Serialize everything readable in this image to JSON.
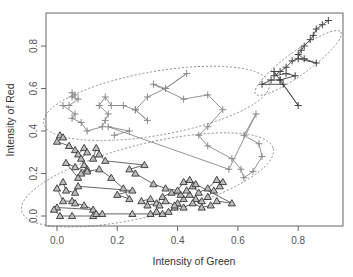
{
  "chart_data": {
    "type": "scatter",
    "title": "",
    "xlabel": "Intensity of Green",
    "ylabel": "Intensity of Red",
    "xlim": [
      -0.04,
      0.95
    ],
    "ylim": [
      -0.05,
      0.95
    ],
    "x_ticks": [
      0.0,
      0.2,
      0.4,
      0.6,
      0.8
    ],
    "x_tick_labels": [
      "0.0",
      "0.2",
      "0.4",
      "0.6",
      "0.8"
    ],
    "y_ticks": [
      0.0,
      0.2,
      0.4,
      0.6,
      0.8
    ],
    "y_tick_labels": [
      "0.0",
      "0.2",
      "0.4",
      "0.6",
      "0.8"
    ],
    "grid": false,
    "legend": null,
    "series": [
      {
        "name": "cluster-dark-plus",
        "marker": "plus",
        "color": "#444444",
        "connected": true,
        "points": [
          [
            0.9,
            0.92
          ],
          [
            0.88,
            0.9
          ],
          [
            0.86,
            0.88
          ],
          [
            0.85,
            0.85
          ],
          [
            0.84,
            0.83
          ],
          [
            0.82,
            0.8
          ],
          [
            0.81,
            0.78
          ],
          [
            0.8,
            0.76
          ],
          [
            0.82,
            0.74
          ],
          [
            0.86,
            0.72
          ],
          [
            0.8,
            0.74
          ],
          [
            0.78,
            0.73
          ],
          [
            0.76,
            0.7
          ],
          [
            0.74,
            0.68
          ],
          [
            0.72,
            0.66
          ],
          [
            0.76,
            0.67
          ],
          [
            0.79,
            0.66
          ],
          [
            0.74,
            0.64
          ],
          [
            0.71,
            0.64
          ],
          [
            0.68,
            0.62
          ],
          [
            0.75,
            0.62
          ],
          [
            0.8,
            0.52
          ],
          [
            0.74,
            0.64
          ],
          [
            0.72,
            0.68
          ]
        ]
      },
      {
        "name": "cluster-gray-plus",
        "marker": "plus",
        "color": "#888888",
        "connected": true,
        "points": [
          [
            0.05,
            0.58
          ],
          [
            0.06,
            0.57
          ],
          [
            0.05,
            0.56
          ],
          [
            0.07,
            0.55
          ],
          [
            0.04,
            0.52
          ],
          [
            0.02,
            0.52
          ],
          [
            0.06,
            0.48
          ],
          [
            0.05,
            0.46
          ],
          [
            0.08,
            0.44
          ],
          [
            0.1,
            0.4
          ],
          [
            0.15,
            0.42
          ],
          [
            0.16,
            0.45
          ],
          [
            0.17,
            0.48
          ],
          [
            0.14,
            0.52
          ],
          [
            0.16,
            0.56
          ],
          [
            0.18,
            0.52
          ],
          [
            0.22,
            0.52
          ],
          [
            0.26,
            0.5
          ],
          [
            0.3,
            0.45
          ],
          [
            0.26,
            0.5
          ],
          [
            0.3,
            0.56
          ],
          [
            0.36,
            0.6
          ],
          [
            0.43,
            0.67
          ],
          [
            0.36,
            0.6
          ],
          [
            0.32,
            0.62
          ],
          [
            0.42,
            0.55
          ],
          [
            0.5,
            0.57
          ],
          [
            0.55,
            0.5
          ],
          [
            0.5,
            0.42
          ],
          [
            0.47,
            0.38
          ],
          [
            0.5,
            0.33
          ],
          [
            0.58,
            0.27
          ],
          [
            0.61,
            0.22
          ],
          [
            0.62,
            0.18
          ],
          [
            0.65,
            0.21
          ],
          [
            0.68,
            0.28
          ],
          [
            0.67,
            0.34
          ],
          [
            0.62,
            0.38
          ],
          [
            0.66,
            0.48
          ],
          [
            0.57,
            0.22
          ],
          [
            0.17,
            0.42
          ],
          [
            0.24,
            0.4
          ],
          [
            0.19,
            0.38
          ]
        ]
      },
      {
        "name": "cluster-triangles",
        "marker": "triangle",
        "color": "#555555",
        "connected": true,
        "points": [
          [
            0.01,
            0.38
          ],
          [
            0.02,
            0.37
          ],
          [
            0.0,
            0.35
          ],
          [
            0.04,
            0.33
          ],
          [
            0.06,
            0.31
          ],
          [
            0.07,
            0.29
          ],
          [
            0.09,
            0.32
          ],
          [
            0.1,
            0.3
          ],
          [
            0.08,
            0.27
          ],
          [
            0.09,
            0.24
          ],
          [
            0.1,
            0.22
          ],
          [
            0.08,
            0.2
          ],
          [
            0.07,
            0.18
          ],
          [
            0.03,
            0.25
          ],
          [
            0.06,
            0.23
          ],
          [
            0.1,
            0.21
          ],
          [
            0.14,
            0.22
          ],
          [
            0.18,
            0.18
          ],
          [
            0.22,
            0.13
          ],
          [
            0.24,
            0.08
          ],
          [
            0.2,
            0.1
          ],
          [
            0.25,
            0.12
          ],
          [
            0.07,
            0.14
          ],
          [
            0.06,
            0.11
          ],
          [
            0.03,
            0.12
          ],
          [
            0.02,
            0.16
          ],
          [
            0.0,
            0.13
          ],
          [
            0.02,
            0.07
          ],
          [
            0.05,
            0.07
          ],
          [
            0.06,
            0.06
          ],
          [
            0.09,
            0.05
          ],
          [
            0.12,
            0.03
          ],
          [
            0.0,
            0.04
          ],
          [
            -0.01,
            0.03
          ],
          [
            0.01,
            0.0
          ],
          [
            0.05,
            0.0
          ],
          [
            0.12,
            0.0
          ],
          [
            0.13,
            0.01
          ],
          [
            0.15,
            0.01
          ],
          [
            0.25,
            0.01
          ],
          [
            0.31,
            0.01
          ],
          [
            0.33,
            0.02
          ],
          [
            0.35,
            0.01
          ],
          [
            0.37,
            0.02
          ],
          [
            0.39,
            0.04
          ],
          [
            0.4,
            0.06
          ],
          [
            0.42,
            0.08
          ],
          [
            0.44,
            0.1
          ],
          [
            0.46,
            0.08
          ],
          [
            0.48,
            0.07
          ],
          [
            0.5,
            0.09
          ],
          [
            0.52,
            0.12
          ],
          [
            0.54,
            0.14
          ],
          [
            0.55,
            0.16
          ],
          [
            0.53,
            0.17
          ],
          [
            0.5,
            0.13
          ],
          [
            0.47,
            0.11
          ],
          [
            0.45,
            0.14
          ],
          [
            0.43,
            0.12
          ],
          [
            0.41,
            0.1
          ],
          [
            0.38,
            0.11
          ],
          [
            0.35,
            0.09
          ],
          [
            0.33,
            0.06
          ],
          [
            0.3,
            0.05
          ],
          [
            0.28,
            0.07
          ],
          [
            0.31,
            0.08
          ],
          [
            0.34,
            0.05
          ],
          [
            0.36,
            0.07
          ],
          [
            0.39,
            0.05
          ],
          [
            0.42,
            0.04
          ],
          [
            0.45,
            0.06
          ],
          [
            0.48,
            0.04
          ],
          [
            0.51,
            0.05
          ],
          [
            0.53,
            0.07
          ],
          [
            0.58,
            0.06
          ],
          [
            0.46,
            0.15
          ],
          [
            0.44,
            0.17
          ],
          [
            0.42,
            0.16
          ],
          [
            0.4,
            0.12
          ],
          [
            0.36,
            0.13
          ],
          [
            0.32,
            0.15
          ],
          [
            0.26,
            0.2
          ],
          [
            0.24,
            0.22
          ],
          [
            0.29,
            0.24
          ],
          [
            0.16,
            0.26
          ],
          [
            0.14,
            0.29
          ],
          [
            0.12,
            0.27
          ],
          [
            0.13,
            0.32
          ]
        ]
      }
    ],
    "ellipses": [
      {
        "name": "ellipse-top-right",
        "cx": 0.8,
        "cy": 0.72,
        "rx": 0.175,
        "ry": 0.055,
        "angle_deg": -36
      },
      {
        "name": "ellipse-gray",
        "cx": 0.33,
        "cy": 0.53,
        "rx": 0.38,
        "ry": 0.15,
        "angle_deg": -10
      },
      {
        "name": "ellipse-triangles",
        "cx": 0.3,
        "cy": 0.17,
        "rx": 0.43,
        "ry": 0.17,
        "angle_deg": -14
      }
    ]
  }
}
